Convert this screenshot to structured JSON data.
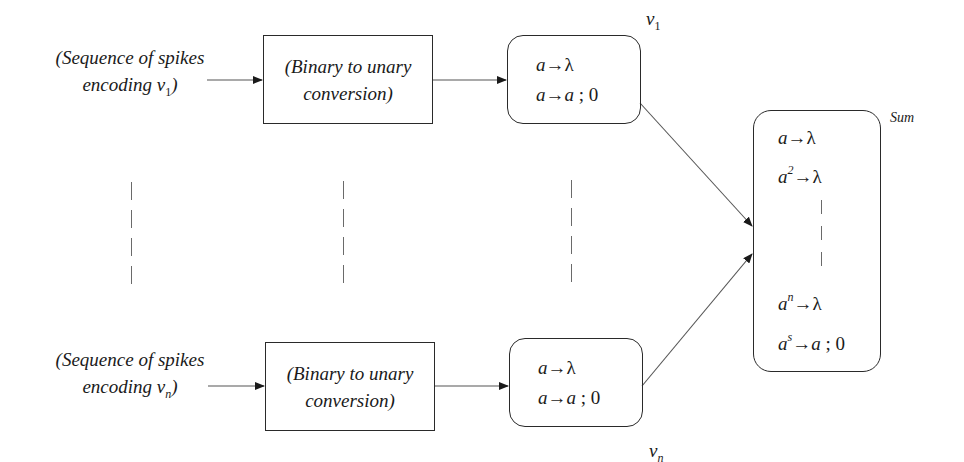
{
  "diagram": {
    "type": "spiking neural P system addition module",
    "colors": {
      "stroke": "#2a2a2a",
      "text": "#1a1a1a",
      "background": "#ffffff",
      "dashes": "#6a6a6a"
    },
    "rows": [
      {
        "input": {
          "line1": "(Sequence of spikes",
          "line2_prefix": "encoding ",
          "var": "v",
          "sub": "1",
          "close": ")"
        },
        "converter": {
          "line1": "(Binary to unary",
          "line2": "conversion)"
        },
        "neuron": {
          "label_var": "v",
          "label_sub": "1",
          "rules": [
            {
              "lhs": "a",
              "lhs_exp": "",
              "rhs": "λ",
              "delay": ""
            },
            {
              "lhs": "a",
              "lhs_exp": "",
              "rhs": "a",
              "delay": " ; 0"
            }
          ]
        }
      },
      {
        "input": {
          "line1": "(Sequence of spikes",
          "line2_prefix": "encoding ",
          "var": "v",
          "sub": "n",
          "close": ")"
        },
        "converter": {
          "line1": "(Binary to unary",
          "line2": "conversion)"
        },
        "neuron": {
          "label_var": "v",
          "label_sub": "n",
          "rules": [
            {
              "lhs": "a",
              "lhs_exp": "",
              "rhs": "λ",
              "delay": ""
            },
            {
              "lhs": "a",
              "lhs_exp": "",
              "rhs": "a",
              "delay": " ; 0"
            }
          ]
        }
      }
    ],
    "sum_neuron": {
      "label": "Sum",
      "rules_top": [
        {
          "lhs": "a",
          "lhs_exp": "",
          "rhs": "λ",
          "delay": ""
        },
        {
          "lhs": "a",
          "lhs_exp": "2",
          "rhs": "λ",
          "delay": ""
        }
      ],
      "rules_bottom": [
        {
          "lhs": "a",
          "lhs_exp": "n",
          "rhs": "λ",
          "delay": ""
        },
        {
          "lhs": "a",
          "lhs_exp": "s",
          "rhs": "a",
          "delay": " ; 0"
        }
      ]
    },
    "arrow_symbol": "→"
  }
}
